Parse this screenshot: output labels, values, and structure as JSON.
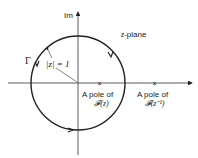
{
  "diagram": {
    "axis_imag_label": "Im",
    "plane_label": "z-plane",
    "contour_label": "Γ",
    "radius_label": "|z| = 1",
    "poles": [
      {
        "line1": "A pole of",
        "line2": "𝓕(z)"
      },
      {
        "line1": "A pole of",
        "line2": "𝓕(z⁻¹)"
      }
    ],
    "pole_marker": "×",
    "colors": {
      "stroke": "#222222",
      "background": "#ffffff"
    }
  }
}
